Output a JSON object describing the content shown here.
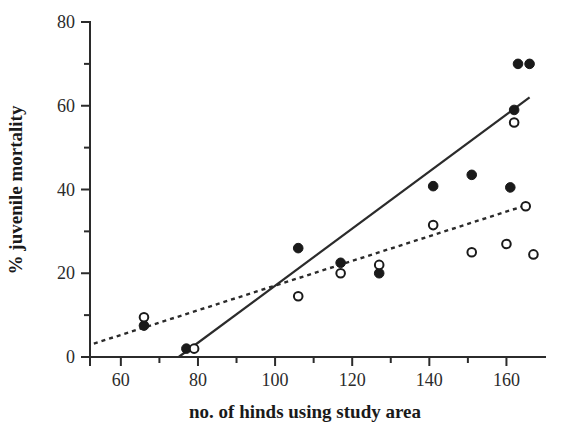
{
  "chart_data": {
    "type": "scatter",
    "title": "",
    "xlabel": "no. of hinds using study area",
    "ylabel": "% juvenile mortality",
    "xlim": [
      52,
      170
    ],
    "ylim": [
      0,
      80
    ],
    "grid": false,
    "legend": "none",
    "x_ticks_major": [
      60,
      80,
      100,
      120,
      140,
      160
    ],
    "x_ticks_minor": [
      70,
      90,
      110,
      130,
      150
    ],
    "y_ticks_major": [
      0,
      20,
      40,
      60,
      80
    ],
    "y_ticks_minor": [
      10,
      30,
      50,
      70
    ],
    "x_tick_labels": [
      "60",
      "80",
      "100",
      "120",
      "140",
      "160"
    ],
    "y_tick_labels": [
      "0",
      "20",
      "40",
      "60",
      "80"
    ],
    "series": [
      {
        "name": "filled-circles",
        "marker": "filled-circle",
        "color": "#1a1a1a",
        "points": [
          [
            66,
            7.5
          ],
          [
            77,
            2.0
          ],
          [
            106,
            26.0
          ],
          [
            117,
            22.5
          ],
          [
            127,
            20.0
          ],
          [
            141,
            40.8
          ],
          [
            151,
            43.5
          ],
          [
            161,
            40.5
          ],
          [
            162,
            59.0
          ],
          [
            163,
            70.0
          ],
          [
            166,
            70.0
          ]
        ]
      },
      {
        "name": "open-circles",
        "marker": "open-circle",
        "color": "#1a1a1a",
        "points": [
          [
            66,
            9.5
          ],
          [
            79,
            2.0
          ],
          [
            106,
            14.5
          ],
          [
            117,
            20.0
          ],
          [
            127,
            22.0
          ],
          [
            141,
            31.5
          ],
          [
            151,
            25.0
          ],
          [
            160,
            27.0
          ],
          [
            162,
            56.0
          ],
          [
            165,
            36.0
          ],
          [
            167,
            24.5
          ]
        ]
      }
    ],
    "trend_lines": [
      {
        "name": "solid-regression-line",
        "style": "solid",
        "color": "#2b2b2b",
        "x_start": 75,
        "y_start": 0,
        "x_end": 166,
        "y_end": 62
      },
      {
        "name": "dotted-regression-line",
        "style": "dotted",
        "color": "#2b2b2b",
        "x_start": 53,
        "y_start": 3.2,
        "x_end": 166,
        "y_end": 36.5
      }
    ]
  }
}
